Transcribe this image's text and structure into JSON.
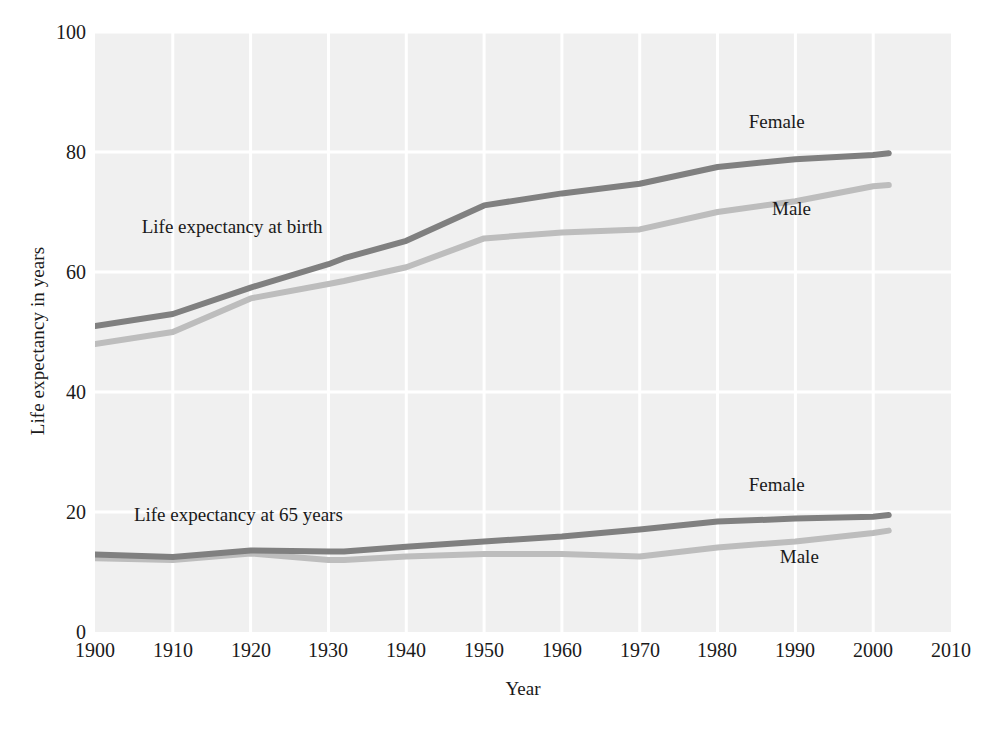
{
  "chart_data": {
    "type": "line",
    "title": "",
    "xlabel": "Year",
    "ylabel": "Life expectancy in years",
    "xlim": [
      1900,
      2010
    ],
    "ylim": [
      0,
      100
    ],
    "grid": true,
    "legend": "inline-annotations",
    "xticks": [
      "1900",
      "1910",
      "1920",
      "1930",
      "1940",
      "1950",
      "1960",
      "1970",
      "1980",
      "1990",
      "2000",
      "2010"
    ],
    "yticks": [
      "0",
      "20",
      "40",
      "60",
      "80",
      "100"
    ],
    "x": [
      1900,
      1910,
      1920,
      1930,
      1932,
      1940,
      1950,
      1960,
      1970,
      1980,
      1990,
      2000,
      2002
    ],
    "series": [
      {
        "name": "Life expectancy at birth, Female",
        "group": "at-birth",
        "sex": "Female",
        "color": "#808080",
        "values": [
          51.0,
          53.0,
          57.4,
          61.3,
          62.3,
          65.2,
          71.1,
          73.1,
          74.7,
          77.5,
          78.8,
          79.5,
          79.8
        ]
      },
      {
        "name": "Life expectancy at birth, Male",
        "group": "at-birth",
        "sex": "Male",
        "color": "#bdbdbd",
        "values": [
          48.0,
          50.0,
          55.6,
          58.0,
          58.5,
          60.8,
          65.6,
          66.6,
          67.1,
          70.0,
          71.8,
          74.3,
          74.5
        ]
      },
      {
        "name": "Life expectancy at 65 years, Female",
        "group": "at-65",
        "sex": "Female",
        "color": "#808080",
        "values": [
          12.9,
          12.5,
          13.6,
          13.4,
          13.4,
          14.2,
          15.1,
          15.9,
          17.1,
          18.4,
          18.9,
          19.2,
          19.5
        ]
      },
      {
        "name": "Life expectancy at 65 years, Male",
        "group": "at-65",
        "sex": "Male",
        "color": "#bdbdbd",
        "values": [
          12.3,
          12.0,
          13.1,
          12.0,
          12.0,
          12.6,
          13.0,
          13.0,
          12.6,
          14.1,
          15.1,
          16.5,
          16.9
        ]
      }
    ],
    "annotations": [
      {
        "text": "Life expectancy at birth",
        "x": 1906,
        "y": 67.5
      },
      {
        "text": "Life expectancy at 65 years",
        "x": 1905,
        "y": 19.5
      },
      {
        "text": "Female",
        "x": 1984,
        "y": 85.0,
        "series": "at-birth-female"
      },
      {
        "text": "Male",
        "x": 1987,
        "y": 70.5,
        "series": "at-birth-male"
      },
      {
        "text": "Female",
        "x": 1984,
        "y": 24.5,
        "series": "at-65-female"
      },
      {
        "text": "Male",
        "x": 1988,
        "y": 12.5,
        "series": "at-65-male"
      }
    ],
    "colors": {
      "plot_background": "#f0f0f0",
      "gridline": "#ffffff",
      "female_line": "#808080",
      "male_line": "#bdbdbd",
      "text": "#1a1a1a"
    }
  },
  "caption": {
    "text": ""
  }
}
